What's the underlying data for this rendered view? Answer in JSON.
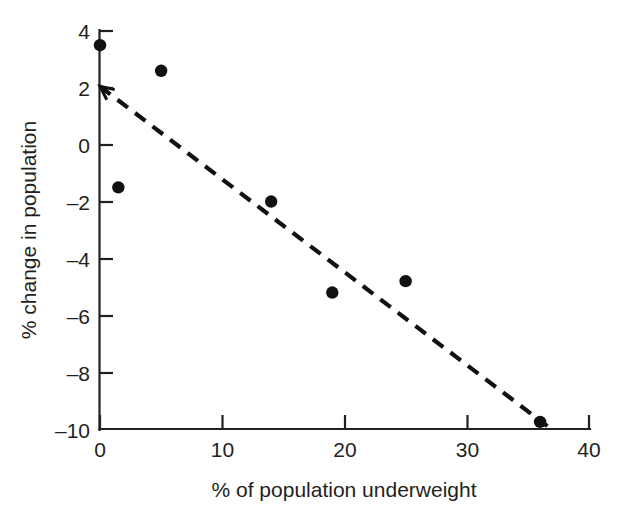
{
  "figure": {
    "background_color": "#ffffff",
    "ink_color": "#231f20"
  },
  "chart_data": {
    "type": "scatter",
    "title": "",
    "xlabel": "% of population underweight",
    "ylabel": "% change in population",
    "xlim": [
      0,
      40
    ],
    "ylim": [
      -10,
      4
    ],
    "xticks": [
      0,
      10,
      20,
      30,
      40
    ],
    "yticks": [
      4,
      2,
      0,
      -2,
      -4,
      -6,
      -8,
      -10
    ],
    "xtick_labels": [
      "0",
      "10",
      "20",
      "30",
      "40"
    ],
    "ytick_labels": [
      "4",
      "2",
      "0",
      "–2",
      "–4",
      "–6",
      "–8",
      "–10"
    ],
    "grid": false,
    "legend": null,
    "marker": "filled-circle",
    "marker_color": "#111111",
    "points": [
      {
        "x": 0.0,
        "y": 3.5
      },
      {
        "x": 5.0,
        "y": 2.6
      },
      {
        "x": 1.5,
        "y": -1.5
      },
      {
        "x": 14.0,
        "y": -2.0
      },
      {
        "x": 19.0,
        "y": -5.2
      },
      {
        "x": 25.0,
        "y": -4.8
      },
      {
        "x": 36.0,
        "y": -9.75
      }
    ],
    "trendline": {
      "style": "dashed",
      "color": "#111111",
      "arrow_at_start": true,
      "x_start": 0.0,
      "y_start": 2.05,
      "x_end": 36.6,
      "y_end": -9.9,
      "slope": -0.327,
      "intercept": 2.05
    }
  },
  "axes": {
    "x_axis_name": "x-axis",
    "y_axis_name": "y-axis"
  }
}
